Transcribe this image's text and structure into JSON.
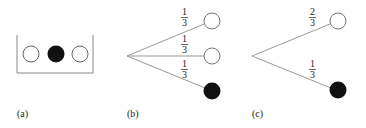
{
  "panels": [
    {
      "label": "(a)",
      "description": "urn with three balls",
      "balls": [
        "white",
        "black",
        "white"
      ]
    },
    {
      "label": "(b)",
      "branches": [
        {
          "num": "1",
          "den": "3",
          "ball": "white"
        },
        {
          "num": "1",
          "den": "3",
          "ball": "white"
        },
        {
          "num": "1",
          "den": "3",
          "ball": "black"
        }
      ]
    },
    {
      "label": "(c)",
      "branches": [
        {
          "num": "2",
          "den": "3",
          "ball": "white"
        },
        {
          "num": "1",
          "den": "3",
          "ball": "black"
        }
      ]
    }
  ],
  "colors": {
    "line": "#888888",
    "black_ball": "#111111",
    "white_ball": "#ffffff",
    "outline": "#777777"
  }
}
